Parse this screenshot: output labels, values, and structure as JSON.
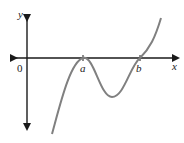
{
  "diagram": {
    "type": "function-graph",
    "axes": {
      "x_label": "x",
      "y_label": "y",
      "origin_label": "0"
    },
    "points": [
      {
        "label": "a",
        "role": "x-intercept (local max touching axis)"
      },
      {
        "label": "b",
        "role": "x-intercept (curve crosses axis)"
      }
    ],
    "colors": {
      "axis": "#1a1a1a",
      "curve": "#808080",
      "text": "#222222"
    }
  }
}
